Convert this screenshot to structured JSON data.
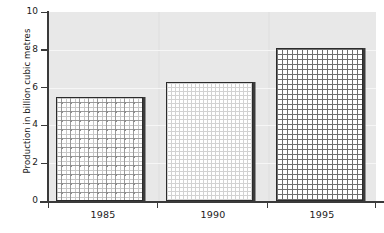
{
  "chart_data": {
    "type": "bar",
    "title": "",
    "xlabel": "",
    "ylabel": "Production in billion cubic metres",
    "categories": [
      "1985",
      "1990",
      "1995"
    ],
    "values": [
      5.5,
      6.3,
      8.1
    ],
    "series": [
      {
        "name": "Production",
        "values": [
          5.5,
          6.3,
          8.1
        ]
      }
    ],
    "ylim": [
      0,
      10
    ],
    "ytick_labels": [
      "0",
      "2",
      "4",
      "6",
      "8",
      "10"
    ],
    "ytick_values": [
      0,
      2,
      4,
      6,
      8,
      10
    ],
    "grid": true,
    "grid_axis": "y",
    "legend": "none",
    "bar_patterns": [
      "cross-dot",
      "fine-dot-grid",
      "crosshatch-grid"
    ],
    "colors": {
      "plot_background": "#e3e3e3",
      "gridline": "#f6f6f6",
      "axis": "#3a3a3a",
      "bar_border": "#2b2b2b",
      "bar_fill": "#ffffff",
      "bar_shadow": "#3b3b3b",
      "text": "#1a1a1a"
    }
  }
}
